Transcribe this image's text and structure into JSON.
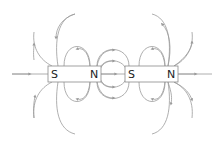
{
  "diagram": {
    "type": "magnetic-field-lines",
    "line_color": "#9a9a9a",
    "magnets": [
      {
        "name": "left-magnet",
        "south_label": "S",
        "north_label": "N"
      },
      {
        "name": "right-magnet",
        "south_label": "S",
        "north_label": "N"
      }
    ]
  }
}
